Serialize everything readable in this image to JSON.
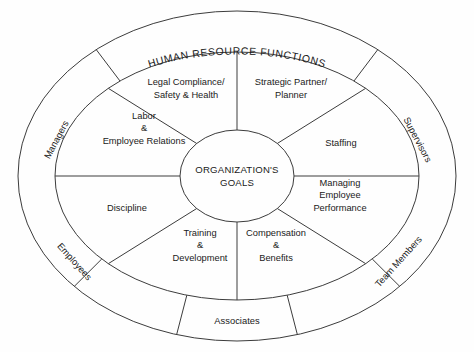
{
  "diagram": {
    "title": "HUMAN RESOURCE FUNCTIONS",
    "center": {
      "line1": "ORGANIZATION'S",
      "line2": "GOALS"
    },
    "inner_sectors": [
      {
        "id": "legal-compliance-safety-health",
        "lines": [
          "Legal Compliance/",
          "Safety & Health"
        ],
        "label_x": 186,
        "label_y": 89
      },
      {
        "id": "strategic-partner-planner",
        "lines": [
          "Strategic Partner/",
          "Planner"
        ],
        "label_x": 291,
        "label_y": 89
      },
      {
        "id": "labor-employee-relations",
        "lines": [
          "Labor",
          "&",
          "Employee Relations"
        ],
        "label_x": 144,
        "label_y": 129
      },
      {
        "id": "staffing",
        "lines": [
          "Staffing"
        ],
        "label_x": 341,
        "label_y": 144
      },
      {
        "id": "managing-employee-performance",
        "lines": [
          "Managing",
          "Employee",
          "Performance"
        ],
        "label_x": 340,
        "label_y": 196
      },
      {
        "id": "discipline",
        "lines": [
          "Discipline"
        ],
        "label_x": 127,
        "label_y": 209
      },
      {
        "id": "training-development",
        "lines": [
          "Training",
          "&",
          "Development"
        ],
        "label_x": 200,
        "label_y": 246
      },
      {
        "id": "compensation-benefits",
        "lines": [
          "Compensation",
          "&",
          "Benefits"
        ],
        "label_x": 276,
        "label_y": 246
      }
    ],
    "outer_sectors": [
      {
        "id": "managers",
        "label": "Managers"
      },
      {
        "id": "supervisors",
        "label": "Supervisors"
      },
      {
        "id": "team-members",
        "label": "Team Members"
      },
      {
        "id": "associates",
        "label": "Associates"
      },
      {
        "id": "employees",
        "label": "Employees"
      }
    ],
    "colors": {
      "stroke": "#3c3c3c",
      "text": "#1a1a1a",
      "background": "#fefefe"
    }
  }
}
